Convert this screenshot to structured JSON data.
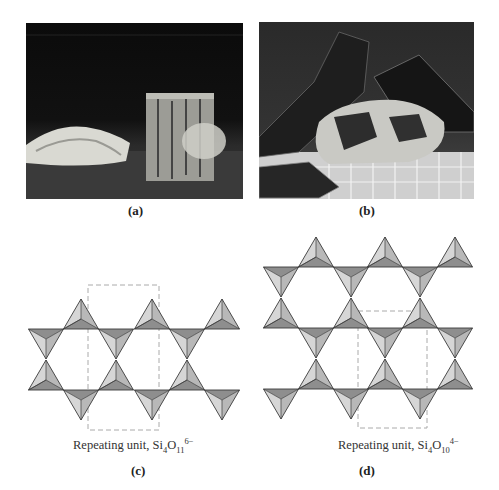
{
  "figure": {
    "panels": [
      {
        "id": "a",
        "caption": "(a)",
        "type": "photo",
        "subject": "fibrous asbestos sample"
      },
      {
        "id": "b",
        "caption": "(b)",
        "type": "photo",
        "subject": "mica sheets"
      },
      {
        "id": "c",
        "caption": "(c)",
        "type": "diagram",
        "label_prefix": "Repeating unit, ",
        "formula": {
          "el1": "Si",
          "sub1": "4",
          "el2": "O",
          "sub2": "11",
          "charge": "6−"
        }
      },
      {
        "id": "d",
        "caption": "(d)",
        "type": "diagram",
        "label_prefix": "Repeating unit, ",
        "formula": {
          "el1": "Si",
          "sub1": "4",
          "el2": "O",
          "sub2": "10",
          "charge": "4−"
        }
      }
    ]
  },
  "colors": {
    "face_light": "#d6d6d6",
    "face_mid": "#b8b8b8",
    "face_dark": "#8e8e8e",
    "edge": "#3a3a3a",
    "dashed_box": "#aaaaaa"
  }
}
